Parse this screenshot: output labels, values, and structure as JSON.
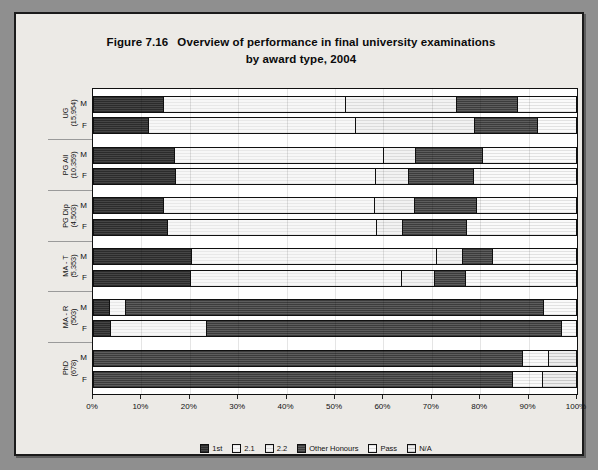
{
  "figure": {
    "number": "Figure 7.16",
    "title_line1": "Overview of performance in final university examinations",
    "title_line2": "by award type, 2004"
  },
  "legend": {
    "position": "bottom-center",
    "items": [
      {
        "label": "1st",
        "key": "1st",
        "color": "#343434"
      },
      {
        "label": "2.1",
        "key": "2.1",
        "color": "#f0f0f0"
      },
      {
        "label": "2.2",
        "key": "2.2",
        "color": "#e9e9e9"
      },
      {
        "label": "Other Honours",
        "key": "Other Honours",
        "color": "#4a4a4a"
      },
      {
        "label": "Pass",
        "key": "Pass",
        "color": "#eeeeee"
      },
      {
        "label": "N/A",
        "key": "N/A",
        "color": "#dcdcdc"
      }
    ]
  },
  "axis": {
    "x_ticks": [
      "0%",
      "10%",
      "20%",
      "30%",
      "40%",
      "50%",
      "60%",
      "70%",
      "80%",
      "90%",
      "100%"
    ],
    "x_min": 0,
    "x_max": 100
  },
  "groups": [
    {
      "name": "UG",
      "count": "(15,954)",
      "label_line1": "UG",
      "label_line2": "(15,954)"
    },
    {
      "name": "PG All",
      "count": "(10,359)",
      "label_line1": "PG All",
      "label_line2": "(10,359)"
    },
    {
      "name": "PG Dip",
      "count": "(4,503)",
      "label_line1": "PG Dip",
      "label_line2": "(4,503)"
    },
    {
      "name": "MA - T",
      "count": "(5,353)",
      "label_line1": "MA - T",
      "label_line2": "(5,353)"
    },
    {
      "name": "MA - R",
      "count": "(503)",
      "label_line1": "MA - R",
      "label_line2": "(503)"
    },
    {
      "name": "PhD",
      "count": "(678)",
      "label_line1": "PhD",
      "label_line2": "(678)"
    }
  ],
  "sex_labels": [
    "M",
    "F"
  ],
  "chart_data": {
    "type": "bar",
    "orientation": "horizontal",
    "stacked": true,
    "stacked_percent": true,
    "xlabel": "",
    "ylabel": "",
    "xlim": [
      0,
      100
    ],
    "grid": false,
    "legend_position": "bottom-center",
    "series_names": [
      "1st",
      "2.1",
      "2.2",
      "Other Honours",
      "Pass",
      "N/A"
    ],
    "categories": [
      "UG (15,954) M",
      "UG (15,954) F",
      "PG All (10,359) M",
      "PG All (10,359) F",
      "PG Dip (4,503) M",
      "PG Dip (4,503) F",
      "MA - T (5,353) M",
      "MA - T (5,353) F",
      "MA - R (503) M",
      "MA - R (503) F",
      "PhD (678) M",
      "PhD (678) F"
    ],
    "rows": [
      {
        "group": "UG",
        "sex": "M",
        "values": {
          "1st": 14.3,
          "2.1": 37.8,
          "2.2": 23.1,
          "Other Honours": 12.6,
          "Pass": 12.2,
          "N/A": 0.0
        }
      },
      {
        "group": "UG",
        "sex": "F",
        "values": {
          "1st": 11.2,
          "2.1": 43.0,
          "2.2": 24.6,
          "Other Honours": 13.2,
          "Pass": 8.0,
          "N/A": 0.0
        }
      },
      {
        "group": "PG All",
        "sex": "M",
        "values": {
          "1st": 16.5,
          "2.1": 43.5,
          "2.2": 6.6,
          "Other Honours": 14.0,
          "Pass": 19.4,
          "N/A": 0.0
        }
      },
      {
        "group": "PG All",
        "sex": "F",
        "values": {
          "1st": 16.9,
          "2.1": 41.3,
          "2.2": 7.0,
          "Other Honours": 13.4,
          "Pass": 21.4,
          "N/A": 0.0
        }
      },
      {
        "group": "PG Dip",
        "sex": "M",
        "values": {
          "1st": 14.3,
          "2.1": 43.8,
          "2.2": 8.3,
          "Other Honours": 12.8,
          "Pass": 20.8,
          "N/A": 0.0
        }
      },
      {
        "group": "PG Dip",
        "sex": "F",
        "values": {
          "1st": 15.1,
          "2.1": 43.4,
          "2.2": 5.4,
          "Other Honours": 13.2,
          "Pass": 22.9,
          "N/A": 0.0
        }
      },
      {
        "group": "MA - T",
        "sex": "M",
        "values": {
          "1st": 20.2,
          "2.1": 50.8,
          "2.2": 5.4,
          "Other Honours": 6.2,
          "Pass": 17.4,
          "N/A": 0.0
        }
      },
      {
        "group": "MA - T",
        "sex": "F",
        "values": {
          "1st": 20.0,
          "2.1": 43.6,
          "2.2": 7.0,
          "Other Honours": 6.4,
          "Pass": 23.0,
          "N/A": 0.0
        }
      },
      {
        "group": "MA - R",
        "sex": "M",
        "values": {
          "1st": 3.1,
          "2.1": 3.3,
          "2.2": 0.0,
          "Other Honours": 86.8,
          "Pass": 6.8,
          "N/A": 0.0
        }
      },
      {
        "group": "MA - R",
        "sex": "F",
        "values": {
          "1st": 3.3,
          "2.1": 20.0,
          "2.2": 0.0,
          "Other Honours": 73.5,
          "Pass": 3.2,
          "N/A": 0.0
        }
      },
      {
        "group": "PhD",
        "sex": "M",
        "values": {
          "1st": 0.0,
          "2.1": 0.0,
          "2.2": 0.0,
          "Other Honours": 88.8,
          "Pass": 5.4,
          "N/A": 5.8
        }
      },
      {
        "group": "PhD",
        "sex": "F",
        "values": {
          "1st": 0.0,
          "2.1": 0.0,
          "2.2": 0.0,
          "Other Honours": 86.8,
          "Pass": 6.2,
          "N/A": 7.0
        }
      }
    ]
  }
}
